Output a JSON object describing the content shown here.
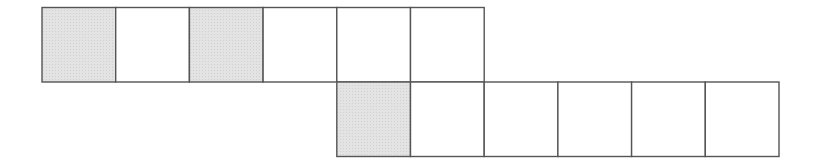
{
  "diagram": {
    "type": "grid-net",
    "rows": [
      {
        "cells": [
          {
            "shaded": true
          },
          {
            "shaded": false
          },
          {
            "shaded": true
          },
          {
            "shaded": false
          },
          {
            "shaded": false
          },
          {
            "shaded": false
          }
        ],
        "column_offset": 0
      },
      {
        "cells": [
          {
            "shaded": true
          },
          {
            "shaded": false
          },
          {
            "shaded": false
          },
          {
            "shaded": false
          },
          {
            "shaded": false
          },
          {
            "shaded": false
          }
        ],
        "column_offset": 4
      }
    ],
    "colors": {
      "shaded_fill": "#e3e3e3",
      "empty_fill": "#ffffff",
      "stroke": "#555555"
    }
  }
}
